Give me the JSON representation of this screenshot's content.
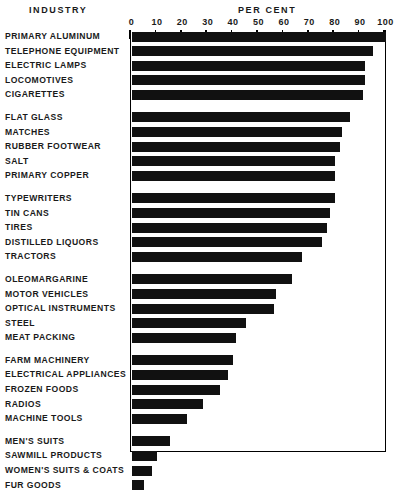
{
  "headings": {
    "industry": "INDUSTRY",
    "percent": "PER CENT"
  },
  "chart_data": {
    "type": "bar",
    "orientation": "horizontal",
    "title": "",
    "xlabel": "PER CENT",
    "ylabel": "INDUSTRY",
    "xlim": [
      0,
      100
    ],
    "xticks": [
      0,
      10,
      20,
      30,
      40,
      50,
      60,
      70,
      80,
      90,
      100
    ],
    "xtick_labels": [
      "0",
      "10",
      "20",
      "30",
      "40",
      "50",
      "60",
      "70",
      "80",
      "90",
      "100"
    ],
    "grid": false,
    "legend": false,
    "bar_color": "#111111",
    "background_color": "#ffffff",
    "categories": [
      "PRIMARY ALUMINUM",
      "TELEPHONE EQUIPMENT",
      "ELECTRIC LAMPS",
      "LOCOMOTIVES",
      "CIGARETTES",
      "FLAT GLASS",
      "MATCHES",
      "RUBBER FOOTWEAR",
      "SALT",
      "PRIMARY COPPER",
      "TYPEWRITERS",
      "TIN CANS",
      "TIRES",
      "DISTILLED LIQUORS",
      "TRACTORS",
      "OLEOMARGARINE",
      "MOTOR VEHICLES",
      "OPTICAL INSTRUMENTS",
      "STEEL",
      "MEAT PACKING",
      "FARM MACHINERY",
      "ELECTRICAL APPLIANCES",
      "FROZEN FOODS",
      "RADIOS",
      "MACHINE TOOLS",
      "MEN'S SUITS",
      "SAWMILL PRODUCTS",
      "WOMEN'S SUITS & COATS",
      "FUR GOODS"
    ],
    "values": [
      100,
      95,
      92,
      92,
      91,
      86,
      83,
      82,
      80,
      80,
      80,
      78,
      77,
      75,
      67,
      63,
      57,
      56,
      45,
      41,
      40,
      38,
      35,
      28,
      22,
      15,
      10,
      8,
      5
    ],
    "groups": [
      {
        "start": 0,
        "count": 5
      },
      {
        "start": 5,
        "count": 5
      },
      {
        "start": 10,
        "count": 5
      },
      {
        "start": 15,
        "count": 5
      },
      {
        "start": 20,
        "count": 5
      },
      {
        "start": 25,
        "count": 4
      }
    ]
  }
}
